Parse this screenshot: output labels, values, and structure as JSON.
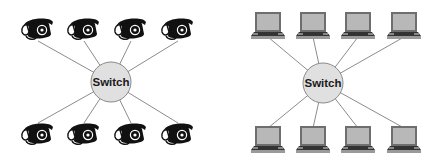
{
  "diagrams": [
    {
      "name": "telephone-network",
      "hub": {
        "label": "Switch",
        "cx": 111,
        "cy": 82,
        "r": 20,
        "fill": "#e0e0e0",
        "stroke": "#8a8a8a"
      },
      "node_type": "telephone",
      "nodes_top": [
        {
          "x": 38,
          "y": 30
        },
        {
          "x": 84,
          "y": 30
        },
        {
          "x": 131,
          "y": 30
        },
        {
          "x": 178,
          "y": 30
        }
      ],
      "nodes_bottom": [
        {
          "x": 38,
          "y": 135
        },
        {
          "x": 84,
          "y": 135
        },
        {
          "x": 131,
          "y": 135
        },
        {
          "x": 178,
          "y": 135
        }
      ]
    },
    {
      "name": "computer-network",
      "hub": {
        "label": "Switch",
        "cx": 323,
        "cy": 83,
        "r": 20,
        "fill": "#e0e0e0",
        "stroke": "#8a8a8a"
      },
      "node_type": "laptop",
      "nodes_top": [
        {
          "x": 268,
          "y": 26
        },
        {
          "x": 313,
          "y": 26
        },
        {
          "x": 358,
          "y": 26
        },
        {
          "x": 404,
          "y": 26
        }
      ],
      "nodes_bottom": [
        {
          "x": 268,
          "y": 140
        },
        {
          "x": 313,
          "y": 140
        },
        {
          "x": 358,
          "y": 140
        },
        {
          "x": 404,
          "y": 140
        }
      ]
    }
  ],
  "colors": {
    "link": "#8c8c8c",
    "phone": "#111111",
    "laptop_screen": "#b8b8b8",
    "laptop_frame": "#6e6e6e",
    "laptop_keyboard": "#333333",
    "laptop_base": "#9a9a9a"
  }
}
